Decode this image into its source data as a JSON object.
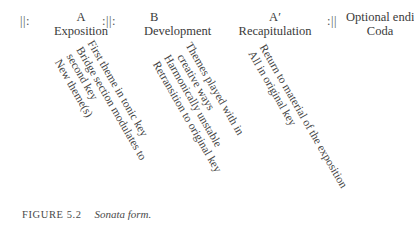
{
  "figure": {
    "repeat_signs": {
      "start": "||:",
      "mid": ":||:",
      "end": ":||"
    },
    "sections": [
      {
        "symbol": "A",
        "name": "Exposition",
        "details": [
          "First theme in tonic key",
          "Bridge section modulates to",
          "second key",
          "New theme(s)"
        ]
      },
      {
        "symbol": "B",
        "name": "Development",
        "details": [
          "Themes played with in",
          "creative ways",
          "Harmonically unstable",
          "Retransition to original key"
        ]
      },
      {
        "symbol": "A′",
        "name": "Recapitulation",
        "details": [
          "Return to material of the exposition",
          "All in original key"
        ]
      },
      {
        "symbol": "Optional ending",
        "name": "Coda",
        "details": []
      }
    ]
  },
  "caption": {
    "label": "FIGURE 5.2",
    "title": "Sonata form."
  }
}
